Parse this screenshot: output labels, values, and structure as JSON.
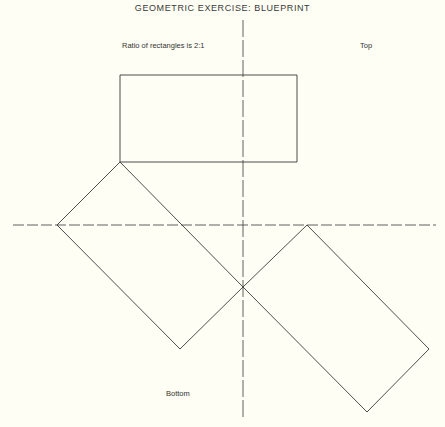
{
  "title": "GEOMETRIC EXERCISE: BLUEPRINT",
  "labels": {
    "ratio": "Ratio of rectangles is 2:1",
    "top": "Top",
    "bottom": "Bottom"
  },
  "diagram": {
    "rectangle_ratio": "2:1",
    "shapes": [
      {
        "name": "top-rectangle",
        "orientation": "horizontal"
      },
      {
        "name": "left-rotated-rectangle",
        "orientation": "rotated 45°"
      },
      {
        "name": "right-rotated-rectangle",
        "orientation": "rotated 45°"
      }
    ],
    "axes": [
      "horizontal-center-line",
      "vertical-center-line"
    ]
  }
}
